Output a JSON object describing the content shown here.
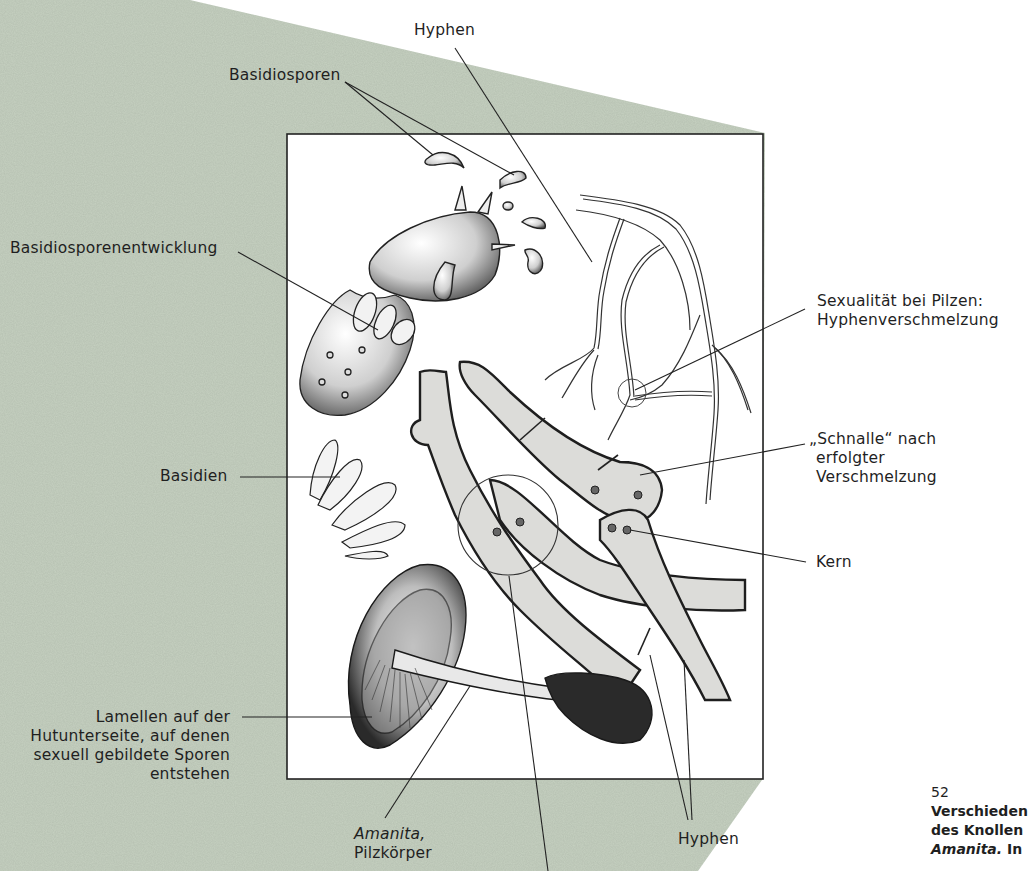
{
  "colors": {
    "background_panel": "#c6d1c1",
    "page": "#ffffff",
    "frame": "#222222",
    "ink": "#1f1f1f",
    "cell_fill": "#d9d9d6"
  },
  "labels": {
    "hyphen_top": "Hyphen",
    "basidiosporen": "Basidiosporen",
    "basidiosporenentwicklung": "Basidiosporenentwicklung",
    "sexualitaet_line1": "Sexualität bei Pilzen:",
    "sexualitaet_line2": "Hyphenverschmelzung",
    "schnalle_line1": "„Schnalle“ nach",
    "schnalle_line2": "erfolgter",
    "schnalle_line3": "Verschmelzung",
    "basidien": "Basidien",
    "kern": "Kern",
    "lamellen_line1": "Lamellen auf der",
    "lamellen_line2": "Hutunterseite, auf denen",
    "lamellen_line3": "sexuell gebildete Sporen",
    "lamellen_line4": "entstehen",
    "amanita_italic": "Amanita,",
    "amanita_line2": "Pilzkörper",
    "hyphen_bottom": "Hyphen"
  },
  "caption": {
    "figure_number": "52",
    "line1": "Verschieden",
    "line2": "des Knollen",
    "line3_italic": "Amanita.",
    "line3_rest": " In"
  }
}
